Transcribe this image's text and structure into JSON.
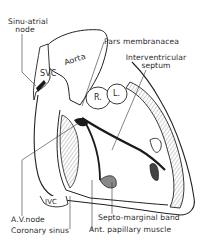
{
  "diagram": {
    "type": "anatomical-line-drawing",
    "colors": {
      "background": "#ffffff",
      "ink": "#222222",
      "shade": "#b8b8b8",
      "dark": "#1a1a1a"
    },
    "labels": {
      "sinu_atrial_node_line1": "Sinu-atrial",
      "sinu_atrial_node_line2": "node",
      "svc": "SVC",
      "aorta": "Aorta",
      "pars_membranacea": "Pars membranacea",
      "interventricular_line1": "Interventricular",
      "interventricular_line2": "septum",
      "r_cusp": "R.",
      "l_cusp": "L.",
      "ivc": "IVC",
      "av_node": "A.V.node",
      "coronary_sinus": "Coronary sinus",
      "septo_marginal_band": "Septo-marginal band",
      "ant_papillary_muscle": "Ant. papillary muscle"
    }
  }
}
